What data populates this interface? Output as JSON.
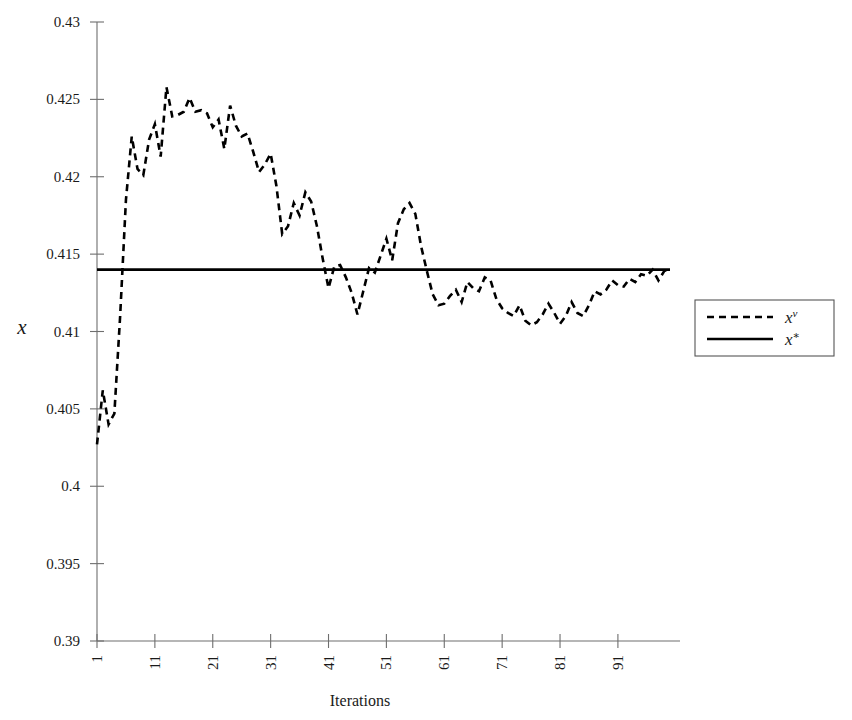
{
  "chart_data": {
    "type": "line",
    "title": "",
    "xlabel": "Iterations",
    "ylabel": "x",
    "xlim": [
      1,
      100
    ],
    "ylim": [
      0.39,
      0.43
    ],
    "grid": false,
    "legend_position": "right",
    "x_ticks": [
      1,
      11,
      21,
      31,
      41,
      51,
      61,
      71,
      81,
      91
    ],
    "x_tick_labels": [
      "1",
      "11",
      "21",
      "31",
      "41",
      "51",
      "61",
      "71",
      "81",
      "91"
    ],
    "y_ticks": [
      0.39,
      0.395,
      0.4,
      0.405,
      0.41,
      0.415,
      0.42,
      0.425,
      0.43
    ],
    "y_tick_labels": [
      "0.39",
      "0.395",
      "0.4",
      "0.405",
      "0.41",
      "0.415",
      "0.42",
      "0.425",
      "0.43"
    ],
    "series": [
      {
        "name": "x^nu",
        "legend_label": "x",
        "legend_superscript": "ν",
        "style": "dashed",
        "color": "#000000",
        "x": [
          1,
          2,
          3,
          4,
          5,
          6,
          7,
          8,
          9,
          10,
          11,
          12,
          13,
          14,
          15,
          16,
          17,
          18,
          19,
          20,
          21,
          22,
          23,
          24,
          25,
          26,
          27,
          28,
          29,
          30,
          31,
          32,
          33,
          34,
          35,
          36,
          37,
          38,
          39,
          40,
          41,
          42,
          43,
          44,
          45,
          46,
          47,
          48,
          49,
          50,
          51,
          52,
          53,
          54,
          55,
          56,
          57,
          58,
          59,
          60,
          61,
          62,
          63,
          64,
          65,
          66,
          67,
          68,
          69,
          70,
          71,
          72,
          73,
          74,
          75,
          76,
          77,
          78,
          79,
          80,
          81,
          82,
          83,
          84,
          85,
          86,
          87,
          88,
          89,
          90,
          91,
          92,
          93,
          94,
          95,
          96,
          97,
          98,
          99,
          100
        ],
        "values": [
          0.4027,
          0.4062,
          0.404,
          0.4047,
          0.411,
          0.4185,
          0.4226,
          0.4205,
          0.4201,
          0.4224,
          0.4234,
          0.4213,
          0.4258,
          0.4239,
          0.424,
          0.4242,
          0.4251,
          0.4242,
          0.4243,
          0.4241,
          0.4232,
          0.4237,
          0.4218,
          0.4246,
          0.4233,
          0.4226,
          0.4228,
          0.4216,
          0.4203,
          0.4208,
          0.4215,
          0.4194,
          0.4163,
          0.4168,
          0.4183,
          0.4175,
          0.419,
          0.4184,
          0.4168,
          0.4147,
          0.4128,
          0.4142,
          0.4143,
          0.4135,
          0.4125,
          0.4111,
          0.4126,
          0.4141,
          0.4138,
          0.4149,
          0.416,
          0.4146,
          0.417,
          0.4179,
          0.4183,
          0.4176,
          0.4155,
          0.4139,
          0.4124,
          0.4117,
          0.4118,
          0.4123,
          0.4127,
          0.4119,
          0.4132,
          0.4128,
          0.4126,
          0.4135,
          0.4133,
          0.4121,
          0.4115,
          0.4112,
          0.411,
          0.4117,
          0.4107,
          0.4104,
          0.4106,
          0.4111,
          0.4118,
          0.4112,
          0.4105,
          0.411,
          0.4119,
          0.4112,
          0.411,
          0.4117,
          0.4126,
          0.4124,
          0.4127,
          0.4133,
          0.413,
          0.4129,
          0.4134,
          0.4132,
          0.4137,
          0.4136,
          0.414,
          0.4133,
          0.4139,
          0.4141
        ]
      },
      {
        "name": "x^star",
        "legend_label": "x",
        "legend_superscript": "∗",
        "style": "solid",
        "color": "#000000",
        "x": [
          1,
          100
        ],
        "values": [
          0.414,
          0.414
        ]
      }
    ]
  },
  "legend": {
    "entries": [
      {
        "label": "x",
        "superscript": "ν",
        "style": "dashed"
      },
      {
        "label": "x",
        "superscript": "∗",
        "style": "solid"
      }
    ]
  }
}
